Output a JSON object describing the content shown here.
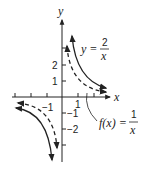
{
  "figure": {
    "axes": {
      "x_label": "x",
      "y_label": "y",
      "x_ticks": [
        {
          "value": -3,
          "label": ""
        },
        {
          "value": -2,
          "label": ""
        },
        {
          "value": -1,
          "label": "−1"
        },
        {
          "value": 1,
          "label": "1"
        },
        {
          "value": 2,
          "label": ""
        }
      ],
      "y_ticks": [
        {
          "value": 3,
          "label": ""
        },
        {
          "value": 2,
          "label": "2"
        },
        {
          "value": 1,
          "label": "1"
        },
        {
          "value": -1,
          "label": "−1"
        },
        {
          "value": -2,
          "label": "−2"
        },
        {
          "value": -3,
          "label": ""
        }
      ]
    },
    "curves": [
      {
        "name": "y = 2/x",
        "style": "solid",
        "label_lhs": "y =",
        "numerator": "2",
        "denominator": "x"
      },
      {
        "name": "f(x) = 1/x",
        "style": "dashed",
        "label_lhs": "f(x) =",
        "numerator": "1",
        "denominator": "x"
      }
    ]
  },
  "colors": {
    "ink": "#222222",
    "background": "#ffffff"
  }
}
